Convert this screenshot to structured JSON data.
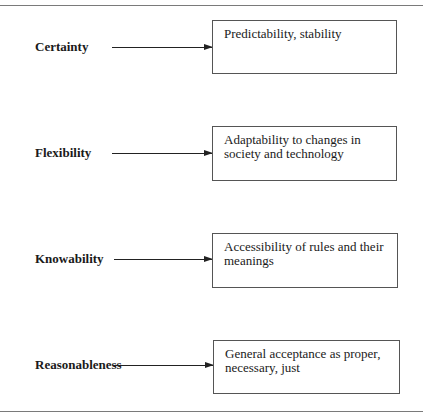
{
  "diagram": {
    "rows": [
      {
        "label": "Certainty",
        "description": "Predictability, stability"
      },
      {
        "label": "Flexibility",
        "description": "Adaptability to changes in society and technology"
      },
      {
        "label": "Knowability",
        "description": "Accessibility of rules and their meanings"
      },
      {
        "label": "Reasonableness",
        "description": "General acceptance as proper, necessary, just"
      }
    ]
  },
  "colors": {
    "line": "#222222",
    "box_border": "#555555",
    "rule": "#7a7a7a"
  }
}
